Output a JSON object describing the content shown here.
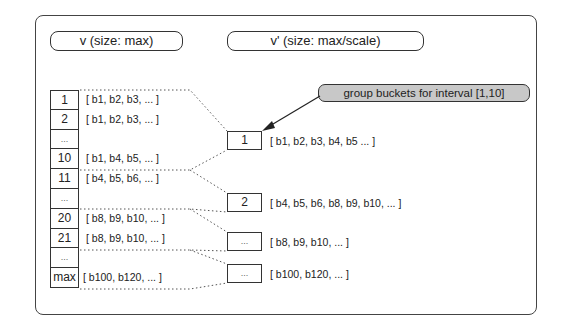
{
  "headers": {
    "left": "v (size: max)",
    "right": "v' (size: max/scale)"
  },
  "callout": {
    "text": "group buckets for interval [1,10]"
  },
  "v_table": {
    "rows": [
      {
        "index": "1",
        "buckets": "[ b1, b2, b3, ... ]"
      },
      {
        "index": "2",
        "buckets": "[ b1, b2, b3, ... ]"
      },
      {
        "index": "...",
        "buckets": ""
      },
      {
        "index": "10",
        "buckets": "[ b1, b4, b5, ... ]"
      },
      {
        "index": "11",
        "buckets": "[ b4, b5, b6, ... ]"
      },
      {
        "index": "...",
        "buckets": ""
      },
      {
        "index": "20",
        "buckets": "[ b8, b9, b10, ... ]"
      },
      {
        "index": "21",
        "buckets": "[ b8, b9, b10, ... ]"
      },
      {
        "index": "...",
        "buckets": ""
      },
      {
        "index": "max",
        "buckets": "[ b100, b120, ... ]"
      }
    ]
  },
  "v_prime": {
    "rows": [
      {
        "index": "1",
        "buckets": "[ b1, b2, b3, b4, b5 ... ]"
      },
      {
        "index": "2",
        "buckets": "[ b4, b5, b6, b8, b9, b10, ... ]"
      },
      {
        "index": "...",
        "buckets": "[ b8, b9, b10, ... ]"
      },
      {
        "index": "...",
        "buckets": "[ b100, b120, ... ]"
      }
    ]
  },
  "colors": {
    "stroke": "#333333",
    "callout_fill": "#c8c8c8",
    "dotted": "#555555"
  }
}
